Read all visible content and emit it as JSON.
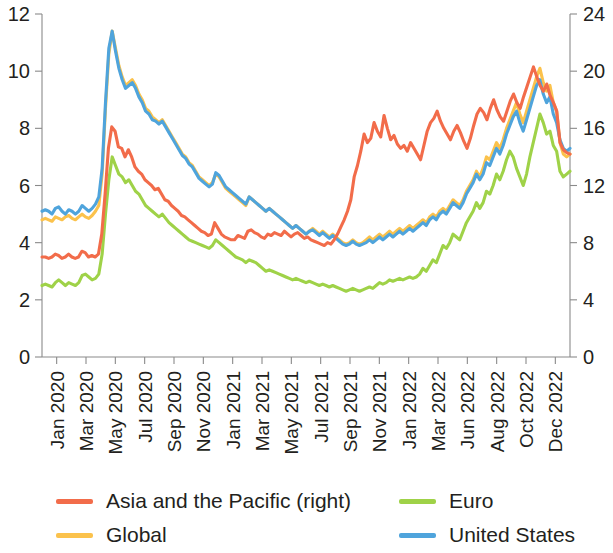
{
  "chart_data": {
    "type": "line",
    "title": "",
    "subtitle": "",
    "xlabel": "",
    "ylabel": "",
    "y2label": "",
    "grid": false,
    "legend_position": "bottom",
    "ylim": [
      0,
      12
    ],
    "y2lim": [
      0,
      24
    ],
    "yticks": [
      "0",
      "2",
      "4",
      "6",
      "8",
      "10",
      "12"
    ],
    "y2ticks": [
      "0",
      "4",
      "8",
      "12",
      "16",
      "20",
      "24"
    ],
    "ytick_values": [
      0,
      2,
      4,
      6,
      8,
      10,
      12
    ],
    "y2tick_values": [
      0,
      4,
      8,
      12,
      16,
      20,
      24
    ],
    "xtick_labels": [
      "Jan 2020",
      "Mar 2020",
      "May 2020",
      "Jul 2020",
      "Sep 2020",
      "Nov 2020",
      "Jan 2021",
      "Mar 2021",
      "May 2021",
      "Jul 2021",
      "Sep 2021",
      "Nov 2021",
      "Jan 2022",
      "Mar 2022",
      "Jun 2022",
      "Aug 2022",
      "Oct 2022",
      "Dec 2022"
    ],
    "x_count": 156,
    "series": [
      {
        "name": "Asia and the Pacific (right)",
        "color": "#F26C4A",
        "axis": "right",
        "values": [
          7.0,
          7.0,
          6.9,
          7.0,
          7.2,
          7.1,
          6.9,
          7.0,
          7.2,
          7.0,
          6.9,
          7.0,
          7.4,
          7.3,
          7.0,
          7.1,
          7.0,
          7.2,
          8.6,
          11.4,
          14.6,
          16.1,
          15.8,
          14.7,
          14.6,
          14.0,
          14.5,
          14.0,
          13.3,
          13.0,
          12.8,
          12.4,
          12.2,
          12.0,
          11.7,
          11.8,
          11.4,
          11.0,
          10.9,
          10.6,
          10.4,
          10.2,
          9.9,
          9.8,
          9.6,
          9.4,
          9.2,
          9.0,
          8.8,
          8.7,
          8.5,
          8.6,
          9.4,
          9.0,
          8.6,
          8.4,
          8.3,
          8.2,
          8.2,
          8.5,
          8.4,
          8.3,
          8.8,
          8.9,
          8.7,
          8.6,
          8.4,
          8.3,
          8.6,
          8.5,
          8.7,
          8.6,
          8.5,
          8.8,
          8.6,
          8.4,
          8.6,
          8.7,
          8.5,
          8.3,
          8.4,
          8.2,
          8.1,
          8.0,
          7.9,
          7.8,
          8.0,
          7.9,
          8.2,
          8.6,
          9.1,
          9.6,
          10.2,
          11.0,
          12.6,
          13.4,
          14.4,
          15.6,
          15.0,
          15.3,
          16.4,
          15.8,
          15.4,
          16.9,
          16.0,
          15.2,
          15.5,
          14.9,
          14.6,
          14.8,
          14.4,
          15.0,
          14.6,
          14.2,
          13.8,
          14.8,
          15.8,
          16.4,
          16.7,
          17.2,
          16.5,
          16.0,
          15.6,
          15.2,
          15.8,
          16.2,
          15.7,
          15.1,
          14.6,
          15.3,
          16.2,
          17.0,
          17.4,
          17.1,
          16.6,
          17.4,
          18.0,
          17.3,
          16.8,
          16.5,
          17.2,
          17.9,
          18.4,
          17.8,
          17.4,
          18.2,
          18.9,
          19.6,
          20.3,
          19.6,
          19.0,
          18.6,
          19.1,
          18.3,
          17.8,
          17.2,
          15.0,
          14.5,
          14.3,
          14.2
        ]
      },
      {
        "name": "Global",
        "color": "#FBC24C",
        "axis": "left",
        "values": [
          4.8,
          4.85,
          4.8,
          4.75,
          4.9,
          4.85,
          4.8,
          4.9,
          4.95,
          4.85,
          4.8,
          4.9,
          5.0,
          4.9,
          4.85,
          4.95,
          5.1,
          5.3,
          6.4,
          8.7,
          10.6,
          11.4,
          10.8,
          10.2,
          9.8,
          9.5,
          9.6,
          9.7,
          9.5,
          9.2,
          9.0,
          8.7,
          8.6,
          8.4,
          8.3,
          8.2,
          8.3,
          8.1,
          7.9,
          7.7,
          7.5,
          7.3,
          7.1,
          7.0,
          6.8,
          6.7,
          6.5,
          6.3,
          6.2,
          6.1,
          6.0,
          6.1,
          6.4,
          6.3,
          6.1,
          5.9,
          5.8,
          5.7,
          5.6,
          5.5,
          5.4,
          5.3,
          5.6,
          5.5,
          5.4,
          5.3,
          5.2,
          5.1,
          5.2,
          5.1,
          5.0,
          4.9,
          4.8,
          4.7,
          4.6,
          4.5,
          4.6,
          4.5,
          4.4,
          4.3,
          4.4,
          4.5,
          4.4,
          4.3,
          4.4,
          4.3,
          4.2,
          4.3,
          4.2,
          4.1,
          4.0,
          3.95,
          4.0,
          4.1,
          4.0,
          3.95,
          4.0,
          4.1,
          4.2,
          4.1,
          4.2,
          4.3,
          4.2,
          4.3,
          4.4,
          4.3,
          4.4,
          4.5,
          4.4,
          4.5,
          4.6,
          4.5,
          4.6,
          4.7,
          4.8,
          4.7,
          4.9,
          5.0,
          4.9,
          5.1,
          5.2,
          5.1,
          5.3,
          5.5,
          5.4,
          5.3,
          5.5,
          5.8,
          6.0,
          6.2,
          6.5,
          6.3,
          6.6,
          7.0,
          6.9,
          7.2,
          7.5,
          7.3,
          7.6,
          8.0,
          8.3,
          8.6,
          8.9,
          8.5,
          8.2,
          8.6,
          9.0,
          9.4,
          9.8,
          10.1,
          9.6,
          9.3,
          9.5,
          8.9,
          8.6,
          7.5,
          7.1,
          7.0,
          7.1
        ]
      },
      {
        "name": "Euro",
        "color": "#9FD248",
        "axis": "left",
        "values": [
          2.5,
          2.55,
          2.5,
          2.45,
          2.6,
          2.7,
          2.6,
          2.5,
          2.6,
          2.55,
          2.5,
          2.6,
          2.85,
          2.9,
          2.8,
          2.7,
          2.75,
          2.9,
          3.6,
          5.0,
          6.2,
          7.0,
          6.7,
          6.4,
          6.3,
          6.1,
          6.2,
          6.0,
          5.8,
          5.7,
          5.5,
          5.3,
          5.2,
          5.1,
          5.0,
          4.9,
          5.0,
          4.85,
          4.7,
          4.6,
          4.5,
          4.4,
          4.3,
          4.2,
          4.1,
          4.05,
          4.0,
          3.95,
          3.9,
          3.85,
          3.8,
          3.9,
          4.1,
          4.0,
          3.9,
          3.8,
          3.7,
          3.6,
          3.5,
          3.45,
          3.4,
          3.3,
          3.4,
          3.35,
          3.3,
          3.2,
          3.1,
          3.0,
          3.05,
          3.0,
          2.95,
          2.9,
          2.85,
          2.8,
          2.75,
          2.7,
          2.75,
          2.7,
          2.65,
          2.6,
          2.65,
          2.6,
          2.55,
          2.5,
          2.55,
          2.5,
          2.45,
          2.5,
          2.45,
          2.4,
          2.35,
          2.3,
          2.35,
          2.4,
          2.35,
          2.3,
          2.35,
          2.4,
          2.45,
          2.4,
          2.5,
          2.6,
          2.55,
          2.6,
          2.7,
          2.65,
          2.7,
          2.75,
          2.7,
          2.75,
          2.8,
          2.75,
          2.8,
          2.9,
          3.1,
          3.0,
          3.2,
          3.4,
          3.3,
          3.6,
          3.9,
          3.8,
          4.0,
          4.3,
          4.2,
          4.1,
          4.4,
          4.7,
          4.9,
          5.1,
          5.4,
          5.2,
          5.4,
          5.8,
          5.7,
          6.0,
          6.4,
          6.2,
          6.5,
          6.9,
          7.2,
          7.0,
          6.6,
          6.3,
          6.0,
          6.4,
          7.0,
          7.5,
          8.0,
          8.5,
          8.2,
          7.8,
          7.9,
          7.4,
          7.2,
          6.5,
          6.3,
          6.4,
          6.5
        ]
      },
      {
        "name": "United States",
        "color": "#4FA4DC",
        "axis": "left",
        "values": [
          5.1,
          5.15,
          5.1,
          5.0,
          5.2,
          5.25,
          5.1,
          5.0,
          5.15,
          5.1,
          5.0,
          5.1,
          5.3,
          5.2,
          5.1,
          5.2,
          5.35,
          5.6,
          6.6,
          8.9,
          10.8,
          11.4,
          10.7,
          10.1,
          9.7,
          9.4,
          9.5,
          9.6,
          9.4,
          9.1,
          8.9,
          8.6,
          8.5,
          8.3,
          8.25,
          8.15,
          8.25,
          8.05,
          7.85,
          7.65,
          7.45,
          7.25,
          7.05,
          6.95,
          6.75,
          6.65,
          6.45,
          6.25,
          6.15,
          6.05,
          5.95,
          6.05,
          6.45,
          6.35,
          6.15,
          5.95,
          5.85,
          5.75,
          5.65,
          5.55,
          5.45,
          5.35,
          5.6,
          5.5,
          5.4,
          5.3,
          5.2,
          5.1,
          5.2,
          5.1,
          5.0,
          4.9,
          4.8,
          4.7,
          4.6,
          4.5,
          4.6,
          4.5,
          4.4,
          4.3,
          4.4,
          4.45,
          4.35,
          4.25,
          4.35,
          4.25,
          4.15,
          4.25,
          4.15,
          4.05,
          3.95,
          3.9,
          3.95,
          4.05,
          3.95,
          3.9,
          3.95,
          4.0,
          4.1,
          4.0,
          4.1,
          4.2,
          4.1,
          4.2,
          4.3,
          4.2,
          4.3,
          4.4,
          4.3,
          4.4,
          4.5,
          4.4,
          4.5,
          4.6,
          4.7,
          4.6,
          4.8,
          4.9,
          4.8,
          5.0,
          5.1,
          5.0,
          5.2,
          5.4,
          5.3,
          5.2,
          5.4,
          5.7,
          5.9,
          6.1,
          6.4,
          6.2,
          6.4,
          6.8,
          6.7,
          7.0,
          7.3,
          7.1,
          7.4,
          7.8,
          8.1,
          8.4,
          8.6,
          8.2,
          7.9,
          8.3,
          8.7,
          9.1,
          9.5,
          9.7,
          9.2,
          8.9,
          9.1,
          8.5,
          8.2,
          7.6,
          7.3,
          7.2,
          7.3
        ]
      }
    ]
  },
  "legend": {
    "items": [
      {
        "label": "Asia and the Pacific (right)",
        "color": "#F26C4A",
        "column": "left"
      },
      {
        "label": "Global",
        "color": "#FBC24C",
        "column": "left"
      },
      {
        "label": "Euro",
        "color": "#9FD248",
        "column": "right"
      },
      {
        "label": "United States",
        "color": "#4FA4DC",
        "column": "right"
      }
    ]
  }
}
